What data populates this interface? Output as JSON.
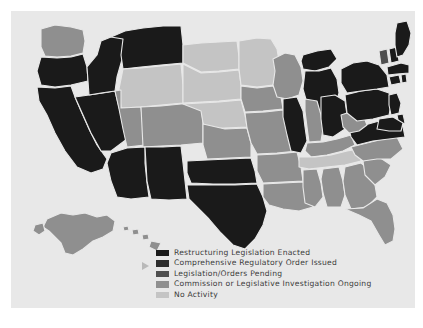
{
  "map": {
    "title": "State Electric Utility Restructuring Status",
    "background_color": "#e8e8e8",
    "border_color": "#ffffff",
    "state_border_color": "#e8e8e8"
  },
  "legend": {
    "items": [
      {
        "label": "Restructuring Legislation Enacted",
        "color": "#1a1a1a",
        "category": "enacted"
      },
      {
        "label": "Comprehensive Regulatory Order Issued",
        "color": "#2e2e2e",
        "category": "order"
      },
      {
        "label": "Legislation/Orders Pending",
        "color": "#4f4f4f",
        "category": "pending"
      },
      {
        "label": "Commission or Legislative Investigation Ongoing",
        "color": "#8f8f8f",
        "category": "investigation"
      },
      {
        "label": "No Activity",
        "color": "#c4c4c4",
        "category": "none"
      }
    ]
  },
  "states": {
    "AL": {
      "name": "Alabama",
      "category": "investigation",
      "color": "#8f8f8f"
    },
    "AK": {
      "name": "Alaska",
      "category": "investigation",
      "color": "#8f8f8f"
    },
    "AZ": {
      "name": "Arizona",
      "category": "enacted",
      "color": "#1a1a1a"
    },
    "AR": {
      "name": "Arkansas",
      "category": "investigation",
      "color": "#8f8f8f"
    },
    "CA": {
      "name": "California",
      "category": "enacted",
      "color": "#1a1a1a"
    },
    "CO": {
      "name": "Colorado",
      "category": "investigation",
      "color": "#8f8f8f"
    },
    "CT": {
      "name": "Connecticut",
      "category": "enacted",
      "color": "#1a1a1a"
    },
    "DE": {
      "name": "Delaware",
      "category": "enacted",
      "color": "#1a1a1a"
    },
    "FL": {
      "name": "Florida",
      "category": "investigation",
      "color": "#8f8f8f"
    },
    "GA": {
      "name": "Georgia",
      "category": "investigation",
      "color": "#8f8f8f"
    },
    "HI": {
      "name": "Hawaii",
      "category": "investigation",
      "color": "#8f8f8f"
    },
    "ID": {
      "name": "Idaho",
      "category": "enacted",
      "color": "#1a1a1a"
    },
    "IL": {
      "name": "Illinois",
      "category": "enacted",
      "color": "#1a1a1a"
    },
    "IN": {
      "name": "Indiana",
      "category": "investigation",
      "color": "#8f8f8f"
    },
    "IA": {
      "name": "Iowa",
      "category": "investigation",
      "color": "#8f8f8f"
    },
    "KS": {
      "name": "Kansas",
      "category": "investigation",
      "color": "#8f8f8f"
    },
    "KY": {
      "name": "Kentucky",
      "category": "investigation",
      "color": "#8f8f8f"
    },
    "LA": {
      "name": "Louisiana",
      "category": "investigation",
      "color": "#8f8f8f"
    },
    "ME": {
      "name": "Maine",
      "category": "enacted",
      "color": "#1a1a1a"
    },
    "MD": {
      "name": "Maryland",
      "category": "enacted",
      "color": "#1a1a1a"
    },
    "MA": {
      "name": "Massachusetts",
      "category": "enacted",
      "color": "#1a1a1a"
    },
    "MI": {
      "name": "Michigan",
      "category": "enacted",
      "color": "#1a1a1a"
    },
    "MN": {
      "name": "Minnesota",
      "category": "none",
      "color": "#c4c4c4"
    },
    "MS": {
      "name": "Mississippi",
      "category": "investigation",
      "color": "#8f8f8f"
    },
    "MO": {
      "name": "Missouri",
      "category": "investigation",
      "color": "#8f8f8f"
    },
    "MT": {
      "name": "Montana",
      "category": "enacted",
      "color": "#1a1a1a"
    },
    "NE": {
      "name": "Nebraska",
      "category": "none",
      "color": "#c4c4c4"
    },
    "NV": {
      "name": "Nevada",
      "category": "enacted",
      "color": "#1a1a1a"
    },
    "NH": {
      "name": "New Hampshire",
      "category": "enacted",
      "color": "#1a1a1a"
    },
    "NJ": {
      "name": "New Jersey",
      "category": "enacted",
      "color": "#1a1a1a"
    },
    "NM": {
      "name": "New Mexico",
      "category": "enacted",
      "color": "#1a1a1a"
    },
    "NY": {
      "name": "New York",
      "category": "enacted",
      "color": "#1a1a1a"
    },
    "NC": {
      "name": "North Carolina",
      "category": "investigation",
      "color": "#8f8f8f"
    },
    "ND": {
      "name": "North Dakota",
      "category": "none",
      "color": "#c4c4c4"
    },
    "OH": {
      "name": "Ohio",
      "category": "enacted",
      "color": "#1a1a1a"
    },
    "OK": {
      "name": "Oklahoma",
      "category": "enacted",
      "color": "#1a1a1a"
    },
    "OR": {
      "name": "Oregon",
      "category": "enacted",
      "color": "#1a1a1a"
    },
    "PA": {
      "name": "Pennsylvania",
      "category": "enacted",
      "color": "#1a1a1a"
    },
    "RI": {
      "name": "Rhode Island",
      "category": "enacted",
      "color": "#1a1a1a"
    },
    "SC": {
      "name": "South Carolina",
      "category": "investigation",
      "color": "#8f8f8f"
    },
    "SD": {
      "name": "South Dakota",
      "category": "none",
      "color": "#c4c4c4"
    },
    "TN": {
      "name": "Tennessee",
      "category": "none",
      "color": "#c4c4c4"
    },
    "TX": {
      "name": "Texas",
      "category": "enacted",
      "color": "#1a1a1a"
    },
    "UT": {
      "name": "Utah",
      "category": "investigation",
      "color": "#8f8f8f"
    },
    "VT": {
      "name": "Vermont",
      "category": "pending",
      "color": "#4f4f4f"
    },
    "VA": {
      "name": "Virginia",
      "category": "enacted",
      "color": "#1a1a1a"
    },
    "WA": {
      "name": "Washington",
      "category": "investigation",
      "color": "#8f8f8f"
    },
    "WV": {
      "name": "West Virginia",
      "category": "investigation",
      "color": "#8f8f8f"
    },
    "WI": {
      "name": "Wisconsin",
      "category": "investigation",
      "color": "#8f8f8f"
    },
    "WY": {
      "name": "Wyoming",
      "category": "none",
      "color": "#c4c4c4"
    }
  }
}
